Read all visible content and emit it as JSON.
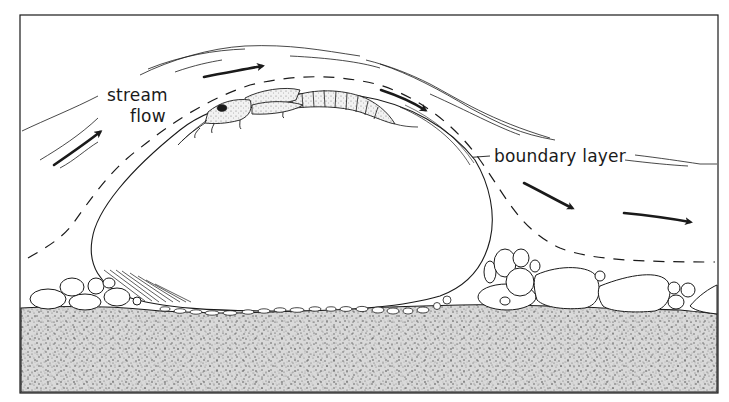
{
  "diagram": {
    "type": "scientific-line-illustration",
    "labels": {
      "stream_flow_line1": "stream",
      "stream_flow_line2": "flow",
      "boundary_layer": "boundary layer"
    },
    "elements": [
      {
        "name": "stream-flow-arrows",
        "count": 5,
        "direction": "left-to-right following rock contour"
      },
      {
        "name": "boundary-layer-dashed-line",
        "style": "dashed"
      },
      {
        "name": "current-streamlines",
        "style": "thin parallel lines"
      },
      {
        "name": "rock",
        "style": "large rounded boulder outline"
      },
      {
        "name": "insect-larva",
        "position": "top of rock, head facing upstream"
      },
      {
        "name": "pebbles",
        "position": "both sides and beneath rock"
      },
      {
        "name": "sand-substrate",
        "style": "stippled"
      }
    ],
    "colors": {
      "ink": "#1a1a1a",
      "background": "#ffffff",
      "stipple": "#7a7a7a"
    }
  }
}
